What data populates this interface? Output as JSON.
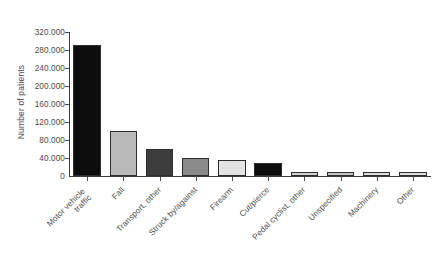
{
  "chart_data": {
    "type": "bar",
    "title": "",
    "subtitle": "",
    "xlabel": "",
    "ylabel": "Number of patients",
    "ylim": [
      0,
      320000
    ],
    "ytick_step": 40000,
    "ytick_labels": [
      "320.000",
      "280.000",
      "240.000",
      "200.000",
      "160.000",
      "120.000",
      "80.000",
      "40.000",
      "0"
    ],
    "ytick_values": [
      320000,
      280000,
      240000,
      200000,
      160000,
      120000,
      80000,
      40000,
      0
    ],
    "grid": false,
    "legend": false,
    "number_format": "european-thousands-dot",
    "categories": [
      "Motor vehicle traffic",
      "Fall",
      "Transport, other",
      "Struck by/against",
      "Firearm",
      "Cut/pierce",
      "Pedal cyclist, other",
      "Unspecified",
      "Machinery",
      "Other"
    ],
    "category_lines": [
      [
        "Motor vehicle",
        "traffic"
      ],
      [
        "Fall"
      ],
      [
        "Transport, other"
      ],
      [
        "Struck by/against"
      ],
      [
        "Firearm"
      ],
      [
        "Cut/pierce"
      ],
      [
        "Pedal cyclist, other"
      ],
      [
        "Unspecified"
      ],
      [
        "Machinery"
      ],
      [
        "Other"
      ]
    ],
    "values": [
      291000,
      100000,
      60000,
      40000,
      36000,
      30000,
      10000,
      10000,
      9000,
      9000
    ],
    "bar_colors": [
      "#0d0d0d",
      "#b9b9b9",
      "#3d3d3d",
      "#8a8a8a",
      "#e2e2e2",
      "#0d0d0d",
      "#d2d2d2",
      "#c4c4c4",
      "#dedede",
      "#dedede"
    ],
    "bar_edge_color": "#2e2e2e",
    "axis_color": "#3c3c3c",
    "background": "#ffffff"
  }
}
